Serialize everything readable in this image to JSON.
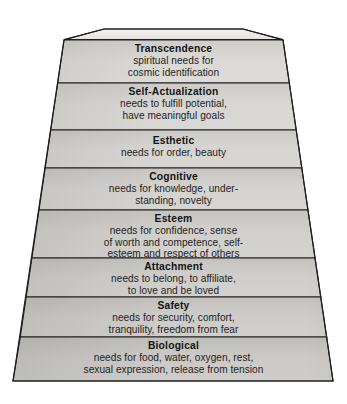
{
  "figure": {
    "name": "hierarchy-of-needs-pyramid",
    "background_color": "#ffffff",
    "outline_color": "#1e1e1e",
    "text_color": "#1b1b1b"
  },
  "apex_cap": {
    "label": "",
    "fill_color": "#eceae7"
  },
  "tiers": [
    {
      "id": "transcendence",
      "title": "Transcendence",
      "lines": [
        "spiritual needs for",
        "cosmic identification"
      ],
      "fill_color": "#d7d5d2"
    },
    {
      "id": "self-actualization",
      "title": "Self-Actualization",
      "lines": [
        "needs to fulfill potential,",
        "have meaningful goals"
      ],
      "fill_color": "#d5d3d0"
    },
    {
      "id": "esthetic",
      "title": "Esthetic",
      "lines": [
        "needs for order, beauty"
      ],
      "fill_color": "#d3d1ce"
    },
    {
      "id": "cognitive",
      "title": "Cognitive",
      "lines": [
        "needs for knowledge, under-",
        "standing, novelty"
      ],
      "fill_color": "#d1cfcb"
    },
    {
      "id": "esteem",
      "title": "Esteem",
      "lines": [
        "needs for confidence, sense",
        "of worth and competence, self-",
        "esteem and respect of others"
      ],
      "fill_color": "#cfcdc9"
    },
    {
      "id": "attachment",
      "title": "Attachment",
      "lines": [
        "needs to belong, to affiliate,",
        "to love and be loved"
      ],
      "fill_color": "#cdcbc7"
    },
    {
      "id": "safety",
      "title": "Safety",
      "lines": [
        "needs for security, comfort,",
        "tranquility, freedom from fear"
      ],
      "fill_color": "#cbc9c5"
    },
    {
      "id": "biological",
      "title": "Biological",
      "lines": [
        "needs for food, water, oxygen, rest,",
        "sexual expression, release from tension"
      ],
      "fill_color": "#c9c7c3"
    }
  ]
}
